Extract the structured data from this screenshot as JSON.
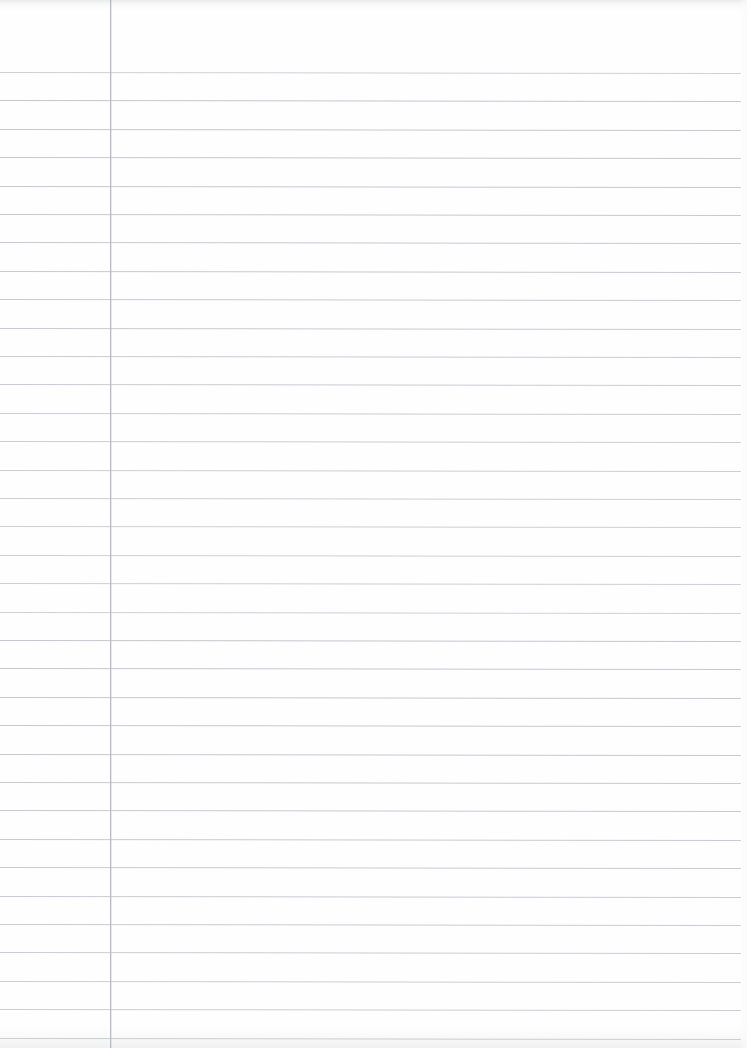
{
  "document": {
    "kind": "scanned-lined-paper",
    "title": "Blank lined notebook page",
    "width": 747,
    "height": 1048,
    "orientation": "portrait",
    "has_handwriting": false,
    "has_printed_text": false,
    "visible_text": "",
    "background_color": "#fefefe"
  },
  "ruling": {
    "style": "wide-ruled-single-margin",
    "line_color": "#c5c7cc",
    "line_thickness_px": 1,
    "first_line_y": 72,
    "line_spacing_px": 28.4,
    "line_count": 35,
    "line_start_x": 0,
    "line_end_x": 741,
    "skew_degrees": 0.075
  },
  "margin_rule": {
    "label": "vertical-margin-line",
    "color": "#b9bbc1",
    "x": 110,
    "thickness_px": 1,
    "top_y": 0,
    "bottom_y": 1048
  },
  "scan_artifacts": {
    "top_edge_shadow": true,
    "bottom_edge_shadow": true,
    "right_edge_falloff": true,
    "shadow_color": "#a8aab0"
  }
}
